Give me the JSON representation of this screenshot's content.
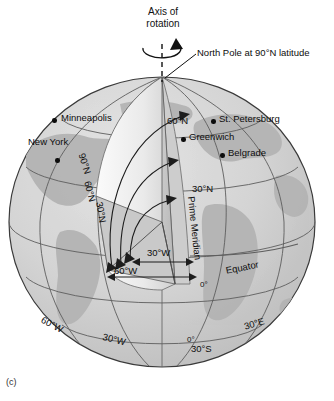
{
  "figure": {
    "caption": "(c)",
    "axis_title_line1": "Axis of",
    "axis_title_line2": "rotation",
    "pole_callout": "North Pole at 90°N latitude"
  },
  "cities": [
    {
      "name": "Minneapolis",
      "dot_x": 54,
      "dot_y": 120,
      "label_x": 61,
      "label_y": 114
    },
    {
      "name": "New York",
      "dot_x": 57,
      "dot_y": 160,
      "label_x": 29,
      "label_y": 138
    },
    {
      "name": "St. Petersburg",
      "dot_x": 213,
      "dot_y": 121,
      "label_x": 220,
      "label_y": 115
    },
    {
      "name": "Greenwich",
      "dot_x": 183,
      "dot_y": 139,
      "label_x": 190,
      "label_y": 133
    },
    {
      "name": "Belgrade",
      "dot_x": 222,
      "dot_y": 155,
      "label_x": 229,
      "label_y": 149
    }
  ],
  "latitude_labels": [
    {
      "text": "60°N",
      "x": 168,
      "y": 117,
      "rotation": 0
    },
    {
      "text": "30°N",
      "x": 193,
      "y": 185,
      "rotation": 0
    },
    {
      "text": "90°N",
      "x": 86,
      "y": 152,
      "rotation": 72
    },
    {
      "text": "60°N",
      "x": 92,
      "y": 180,
      "rotation": 76
    },
    {
      "text": "30°N",
      "x": 104,
      "y": 201,
      "rotation": 80
    }
  ],
  "longitude_labels": [
    {
      "text": "Prime Meridian",
      "x": 196,
      "y": 210,
      "rotation": 84
    },
    {
      "text": "0°",
      "x": 202,
      "y": 285,
      "rotation": 0
    },
    {
      "text": "30°W",
      "x": 150,
      "y": 250,
      "rotation": 0
    },
    {
      "text": "60°W",
      "x": 117,
      "y": 268,
      "rotation": 0
    },
    {
      "text": "60°W",
      "x": 44,
      "y": 317,
      "rotation": 28
    },
    {
      "text": "30°W",
      "x": 104,
      "y": 334,
      "rotation": 14
    },
    {
      "text": "0°",
      "x": 188,
      "y": 340,
      "rotation": 0
    },
    {
      "text": "30°S",
      "x": 192,
      "y": 346,
      "rotation": 0
    },
    {
      "text": "30°E",
      "x": 245,
      "y": 323,
      "rotation": -16
    }
  ],
  "equator_label": {
    "text": "Equator",
    "x": 226,
    "y": 268,
    "rotation": -11
  },
  "colors": {
    "ocean": "#d7d7d7",
    "land": "#b9b9b9",
    "wedge_light": "#f2f2f2",
    "grid": "#5b5b5b",
    "outline": "#3a3a3a",
    "text": "#0d0d0d"
  },
  "geometry": {
    "center_x": 162,
    "center_y": 222,
    "radius_x": 153,
    "radius_y": 145,
    "pole_x": 162,
    "pole_y": 77
  }
}
